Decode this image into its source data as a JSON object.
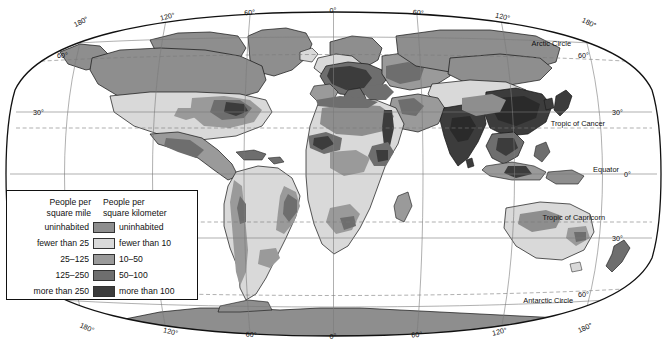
{
  "map": {
    "title": "World Population Density",
    "projection": "oval-world",
    "graticule_labels": {
      "top": [
        "180°",
        "120°",
        "60°",
        "0°",
        "60°",
        "120°",
        "180°"
      ],
      "bottom": [
        "180°",
        "120°",
        "60°",
        "0°",
        "60°",
        "120°",
        "180°"
      ],
      "left": [
        "60°",
        "30°"
      ],
      "right": [
        "60°",
        "30°",
        "0°",
        "30°",
        "60°"
      ]
    },
    "named_lines": [
      {
        "name": "Arctic Circle",
        "label": "Arctic Circle"
      },
      {
        "name": "Tropic of Cancer",
        "label": "Tropic of Cancer"
      },
      {
        "name": "Equator",
        "label": "Equator"
      },
      {
        "name": "Tropic of Capricorn",
        "label": "Tropic of Capricorn"
      },
      {
        "name": "Antarctic Circle",
        "label": "Antarctic Circle"
      }
    ]
  },
  "legend": {
    "heading_left": "People per\nsquare mile",
    "heading_left_line1": "People per",
    "heading_left_line2": "square mile",
    "heading_right_line1": "People per",
    "heading_right_line2": "square kilometer",
    "rows": [
      {
        "left": "uninhabited",
        "right": "uninhabited",
        "color": "#8e8e8e",
        "name": "uninhabited"
      },
      {
        "left": "fewer than 25",
        "right": "fewer than 10",
        "color": "#d9d9d9",
        "name": "low"
      },
      {
        "left": "25–125",
        "right": "10–50",
        "color": "#9a9a9a",
        "name": "medium"
      },
      {
        "left": "125–250",
        "right": "50–100",
        "color": "#6e6e6e",
        "name": "high"
      },
      {
        "left": "more than 250",
        "right": "more than 100",
        "color": "#3c3c3c",
        "name": "very-high"
      }
    ]
  },
  "colors": {
    "ocean": "#ffffff",
    "uninhabited": "#8e8e8e",
    "low": "#d9d9d9",
    "medium": "#9a9a9a",
    "high": "#6e6e6e",
    "very_high": "#3c3c3c",
    "graticule": "#7a7a7a",
    "coast": "#111111",
    "frame": "#111111"
  }
}
